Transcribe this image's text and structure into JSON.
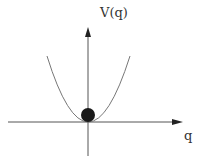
{
  "diagram": {
    "type": "potential-well",
    "y_axis_label": "V(q)",
    "x_axis_label": "q",
    "curve": "parabola",
    "ball": "at minimum",
    "colors": {
      "axis": "#555555",
      "curve": "#777777",
      "ball": "#1a1a1a",
      "text": "#333333"
    }
  }
}
